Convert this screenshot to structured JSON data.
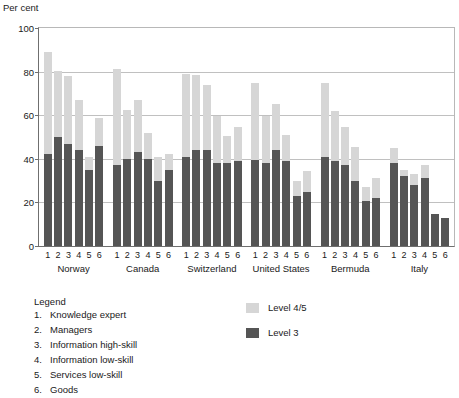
{
  "chart": {
    "title": "",
    "y_axis_title": "Per cent",
    "y_ticks": [
      "0",
      "20",
      "40",
      "60",
      "80",
      "100"
    ]
  },
  "legend": {
    "heading": "Legend",
    "items": [
      {
        "num": "1.",
        "label": "Knowledge expert"
      },
      {
        "num": "2.",
        "label": "Managers"
      },
      {
        "num": "3.",
        "label": "Information high-skill"
      },
      {
        "num": "4.",
        "label": "Information low-skill"
      },
      {
        "num": "5.",
        "label": "Services low-skill"
      },
      {
        "num": "6.",
        "label": "Goods"
      }
    ],
    "series": [
      {
        "label": "Level 4/5",
        "color": "#d6d6d6"
      },
      {
        "label": "Level 3",
        "color": "#555555"
      }
    ]
  },
  "chart_data": {
    "type": "bar",
    "subtype": "stacked-bar-grouped",
    "title": "",
    "xlabel": "",
    "ylabel": "Per cent",
    "ylim": [
      0,
      100
    ],
    "ytick_step": 20,
    "grid": true,
    "legend_position": "below-right",
    "categories": [
      "1",
      "2",
      "3",
      "4",
      "5",
      "6"
    ],
    "category_labels": [
      "Knowledge expert",
      "Managers",
      "Information high-skill",
      "Information low-skill",
      "Services low-skill",
      "Goods"
    ],
    "groups": [
      "Norway",
      "Canada",
      "Switzerland",
      "United States",
      "Bermuda",
      "Italy"
    ],
    "series": [
      {
        "name": "Level 3",
        "color": "#555555",
        "values_by_group": {
          "Norway": [
            42.0,
            50.0,
            47.0,
            44.0,
            35.0,
            46.0
          ],
          "Canada": [
            37.0,
            40.0,
            43.0,
            40.0,
            30.0,
            35.0
          ],
          "Switzerland": [
            41.0,
            44.0,
            44.0,
            38.0,
            38.0,
            39.0
          ],
          "United States": [
            39.5,
            38.0,
            44.0,
            39.0,
            23.0,
            25.0
          ],
          "Bermuda": [
            41.0,
            39.0,
            37.0,
            30.0,
            20.5,
            22.0
          ],
          "Italy": [
            38.0,
            32.0,
            28.0,
            31.0,
            14.5,
            13.0
          ]
        }
      },
      {
        "name": "Level 4/5",
        "color": "#d6d6d6",
        "values_by_group": {
          "Norway": [
            47.0,
            30.5,
            31.0,
            23.0,
            6.0,
            12.5
          ],
          "Canada": [
            44.0,
            22.5,
            24.0,
            12.0,
            11.0,
            7.0
          ],
          "Switzerland": [
            38.0,
            34.5,
            30.0,
            21.5,
            12.5,
            15.5
          ],
          "United States": [
            35.5,
            21.5,
            21.0,
            12.0,
            7.0,
            9.5
          ],
          "Bermuda": [
            34.0,
            23.0,
            17.5,
            15.5,
            6.5,
            9.0
          ],
          "Italy": [
            7.0,
            3.0,
            5.0,
            6.0,
            0.0,
            0.0
          ]
        }
      }
    ],
    "totals_by_group": {
      "Norway": [
        89.0,
        80.5,
        78.0,
        67.0,
        41.0,
        58.5
      ],
      "Canada": [
        81.0,
        62.5,
        67.0,
        52.0,
        41.0,
        42.0
      ],
      "Switzerland": [
        79.0,
        78.5,
        74.0,
        59.5,
        50.5,
        54.5
      ],
      "United States": [
        75.0,
        59.5,
        65.0,
        51.0,
        30.0,
        34.5
      ],
      "Bermuda": [
        75.0,
        62.0,
        54.5,
        45.5,
        27.0,
        31.0
      ],
      "Italy": [
        45.0,
        35.0,
        33.0,
        37.0,
        14.5,
        13.0
      ]
    }
  }
}
